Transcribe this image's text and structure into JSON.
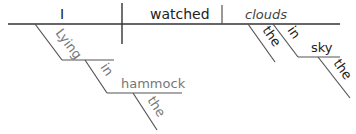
{
  "diagram": {
    "type": "sentence-diagram",
    "sentence": "Lying in the hammock, I watched the clouds in the sky.",
    "subject": "I",
    "verb": "watched",
    "direct_object": "clouds",
    "participial_phrase": {
      "participle": "Lying",
      "preposition": "in",
      "object": "hammock",
      "article": "the"
    },
    "object_modifiers": {
      "article": "the",
      "preposition": "in",
      "object": "sky",
      "object_article": "the"
    }
  }
}
